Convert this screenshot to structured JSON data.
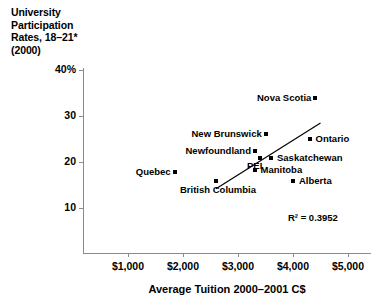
{
  "chart_data": {
    "type": "scatter",
    "title": "University Participation Rates, 18–21* (2000)",
    "title_lines": [
      "University",
      "Participation",
      "Rates, 18–21*",
      "(2000)"
    ],
    "xlabel": "Average Tuition 2000–2001 C$",
    "ylabel": "University Participation Rates, 18–21* (2000)",
    "xlim": [
      500,
      5300
    ],
    "ylim": [
      0,
      42
    ],
    "grid": false,
    "legend": null,
    "x_ticks": [
      1000,
      2000,
      3000,
      4000,
      5000
    ],
    "x_tick_labels": [
      "$1,000",
      "$2,000",
      "$3,000",
      "$4,000",
      "$5,000"
    ],
    "y_ticks": [
      10,
      20,
      30,
      40
    ],
    "y_tick_labels": [
      "10",
      "20",
      "30",
      "40%"
    ],
    "points": [
      {
        "label": "Nova Scotia",
        "x": 4400,
        "y": 34.0,
        "label_side": "left"
      },
      {
        "label": "New Brunswick",
        "x": 3500,
        "y": 26.0,
        "label_side": "left"
      },
      {
        "label": "Ontario",
        "x": 4300,
        "y": 25.0,
        "label_side": "right"
      },
      {
        "label": "Newfoundland",
        "x": 3300,
        "y": 22.5,
        "label_side": "left"
      },
      {
        "label": "PEI",
        "x": 3400,
        "y": 20.8,
        "label_side": "below-left"
      },
      {
        "label": "Saskatchewan",
        "x": 3600,
        "y": 20.8,
        "label_side": "right"
      },
      {
        "label": "Manitoba",
        "x": 3300,
        "y": 18.2,
        "label_side": "right"
      },
      {
        "label": "Quebec",
        "x": 1850,
        "y": 17.8,
        "label_side": "left"
      },
      {
        "label": "British Columbia",
        "x": 2600,
        "y": 15.8,
        "label_side": "below"
      },
      {
        "label": "Alberta",
        "x": 4000,
        "y": 15.8,
        "label_side": "right"
      }
    ],
    "trendline": {
      "x_start": 2600,
      "y_start": 14.2,
      "x_end": 4500,
      "y_end": 28.5
    },
    "annotations": [
      {
        "name": "r-squared",
        "text": "R² = 0.3952"
      }
    ]
  },
  "axes": {
    "x_title": "Average Tuition 2000–2001 C$",
    "y_tick_labels": [
      "40%",
      "30",
      "20",
      "10"
    ],
    "x_tick_labels": [
      "$1,000",
      "$2,000",
      "$3,000",
      "$4,000",
      "$5,000"
    ]
  },
  "title": {
    "line1": "University",
    "line2": "Participation",
    "line3": "Rates, 18–21*",
    "line4": "(2000)"
  },
  "annotation": {
    "r_squared": "R² = 0.3952"
  },
  "colors": {
    "marker": "#000000",
    "trendline": "#000000",
    "axis": "#8a8a8a",
    "text": "#000000",
    "background": "#ffffff"
  }
}
